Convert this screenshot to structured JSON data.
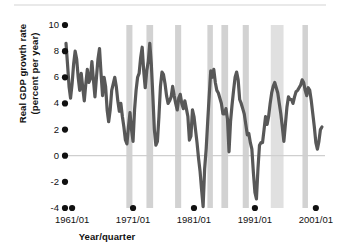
{
  "chart_data": {
    "type": "line",
    "title": "",
    "subtitle": "",
    "xlabel": "Year/quarter",
    "ylabel": "Real GDP growth rate (percent per year)",
    "ylabel_line1": "Real GDP growth rate",
    "ylabel_line2": "(percent per year)",
    "ylim": [
      -4,
      10
    ],
    "yticks": [
      10,
      8,
      6,
      4,
      2,
      0,
      -2,
      -4
    ],
    "ytick_labels": [
      "10",
      "8",
      "6",
      "4",
      "2",
      "0",
      "-2",
      "-4"
    ],
    "xlim": [
      1960.0,
      2002.5
    ],
    "xticks": [
      1961,
      1971,
      1981,
      1991,
      2001
    ],
    "xtick_labels": [
      "1961/01",
      "1971/01",
      "1981/01",
      "1991/01",
      "2001/01"
    ],
    "grid": false,
    "zero_line": true,
    "legend": null,
    "series": [
      {
        "name": "Real GDP growth rate",
        "color": "#585858",
        "line_width": 3.2,
        "x": [
          1960.0,
          1960.25,
          1960.5,
          1960.75,
          1961.0,
          1961.25,
          1961.5,
          1961.75,
          1962.0,
          1962.25,
          1962.5,
          1962.75,
          1963.0,
          1963.25,
          1963.5,
          1963.75,
          1964.0,
          1964.25,
          1964.5,
          1964.75,
          1965.0,
          1965.25,
          1965.5,
          1965.75,
          1966.0,
          1966.25,
          1966.5,
          1966.75,
          1967.0,
          1967.25,
          1967.5,
          1967.75,
          1968.0,
          1968.25,
          1968.5,
          1968.75,
          1969.0,
          1969.25,
          1969.5,
          1969.75,
          1970.0,
          1970.25,
          1970.5,
          1970.75,
          1971.0,
          1971.25,
          1971.5,
          1971.75,
          1972.0,
          1972.25,
          1972.5,
          1972.75,
          1973.0,
          1973.25,
          1973.5,
          1973.75,
          1974.0,
          1974.25,
          1974.5,
          1974.75,
          1975.0,
          1975.25,
          1975.5,
          1975.75,
          1976.0,
          1976.25,
          1976.5,
          1976.75,
          1977.0,
          1977.25,
          1977.5,
          1977.75,
          1978.0,
          1978.25,
          1978.5,
          1978.75,
          1979.0,
          1979.25,
          1979.5,
          1979.75,
          1980.0,
          1980.25,
          1980.5,
          1980.75,
          1981.0,
          1981.25,
          1981.5,
          1981.75,
          1982.0,
          1982.25,
          1982.5,
          1982.75,
          1983.0,
          1983.25,
          1983.5,
          1983.75,
          1984.0,
          1984.25,
          1984.5,
          1984.75,
          1985.0,
          1985.25,
          1985.5,
          1985.75,
          1986.0,
          1986.25,
          1986.5,
          1986.75,
          1987.0,
          1987.25,
          1987.5,
          1987.75,
          1988.0,
          1988.25,
          1988.5,
          1988.75,
          1989.0,
          1989.25,
          1989.5,
          1989.75,
          1990.0,
          1990.25,
          1990.5,
          1990.75,
          1991.0,
          1991.25,
          1991.5,
          1991.75,
          1992.0,
          1992.25,
          1992.5,
          1992.75,
          1993.0,
          1993.25,
          1993.5,
          1993.75,
          1994.0,
          1994.25,
          1994.5,
          1994.75,
          1995.0,
          1995.25,
          1995.5,
          1995.75,
          1996.0,
          1996.25,
          1996.5,
          1996.75,
          1997.0,
          1997.25,
          1997.5,
          1997.75,
          1998.0,
          1998.25,
          1998.5,
          1998.75,
          1999.0,
          1999.25,
          1999.5,
          1999.75,
          2000.0,
          2000.25,
          2000.5,
          2000.75,
          2001.0,
          2001.25,
          2001.5,
          2001.75,
          2002.0
        ],
        "y": [
          8.6,
          7.0,
          5.3,
          4.4,
          5.5,
          7.0,
          8.0,
          7.4,
          6.0,
          5.0,
          6.3,
          5.2,
          4.2,
          5.5,
          6.6,
          5.6,
          5.9,
          7.2,
          5.8,
          4.5,
          6.0,
          7.4,
          8.2,
          6.3,
          4.6,
          6.0,
          5.3,
          3.5,
          2.6,
          3.5,
          5.0,
          5.5,
          6.0,
          5.3,
          4.2,
          3.4,
          4.0,
          3.0,
          2.2,
          1.2,
          0.9,
          2.2,
          3.3,
          2.0,
          1.1,
          3.5,
          5.0,
          6.0,
          6.3,
          7.5,
          8.3,
          6.5,
          5.2,
          6.5,
          7.2,
          8.6,
          7.0,
          4.6,
          2.0,
          0.8,
          1.1,
          3.0,
          5.3,
          6.4,
          6.2,
          5.5,
          4.6,
          4.0,
          4.2,
          4.5,
          5.3,
          4.6,
          4.0,
          3.5,
          4.4,
          4.7,
          4.0,
          3.6,
          4.2,
          3.6,
          3.0,
          1.2,
          1.5,
          3.5,
          3.0,
          2.0,
          1.0,
          -0.2,
          -1.2,
          -2.6,
          -3.9,
          -1.0,
          0.5,
          2.6,
          4.6,
          6.5,
          6.0,
          6.6,
          5.6,
          5.0,
          4.8,
          4.4,
          4.0,
          3.2,
          3.2,
          3.6,
          2.8,
          0.3,
          2.6,
          3.9,
          5.0,
          6.0,
          6.4,
          5.8,
          4.3,
          4.0,
          3.6,
          3.2,
          2.4,
          1.6,
          1.7,
          1.0,
          0.5,
          -1.3,
          -2.8,
          -3.3,
          -1.0,
          0.8,
          1.0,
          1.0,
          2.0,
          3.0,
          2.4,
          3.0,
          4.0,
          4.8,
          5.3,
          5.6,
          5.2,
          4.8,
          4.0,
          3.2,
          2.2,
          1.1,
          2.4,
          3.7,
          4.5,
          4.3,
          4.3,
          4.0,
          4.5,
          4.9,
          5.0,
          5.2,
          5.4,
          5.8,
          5.6,
          5.0,
          4.6,
          5.2,
          5.0,
          4.2,
          3.2,
          2.2,
          1.0,
          0.5,
          1.1,
          2.0,
          2.2
        ]
      }
    ],
    "recession_bands": {
      "color": "#d2d2d2",
      "color_light": "#e0e0e0",
      "label": "Recession",
      "spans": [
        {
          "start": 1969.9,
          "end": 1970.9
        },
        {
          "start": 1973.2,
          "end": 1974.3
        },
        {
          "start": 1977.9,
          "end": 1978.9
        },
        {
          "start": 1983.2,
          "end": 1984.1
        },
        {
          "start": 1985.5,
          "end": 1986.6
        },
        {
          "start": 1989.0,
          "end": 1990.0
        },
        {
          "start": 1993.6,
          "end": 1995.7,
          "light": true
        },
        {
          "start": 1998.8,
          "end": 1999.7
        },
        {
          "start": 2003.8,
          "end": 2004.8
        }
      ]
    },
    "tick_marker": {
      "shape": "dot",
      "color": "#111111"
    }
  }
}
